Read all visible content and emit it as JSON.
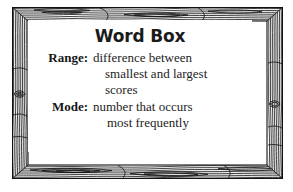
{
  "figure": {
    "kind": "word-box-poster",
    "frame_style": "wood-grain",
    "colors": {
      "ink": "#1b1b1b",
      "paper": "#ffffff",
      "grain": "#111111"
    }
  },
  "card": {
    "title": "Word Box",
    "entries": [
      {
        "term": "Range:",
        "definition": "difference between smallest and largest scores",
        "lines": [
          "difference between",
          "smallest and largest",
          "scores"
        ]
      },
      {
        "term": "Mode:",
        "definition": "number that occurs most frequently",
        "lines": [
          "number that occurs",
          "most frequently"
        ]
      }
    ]
  }
}
